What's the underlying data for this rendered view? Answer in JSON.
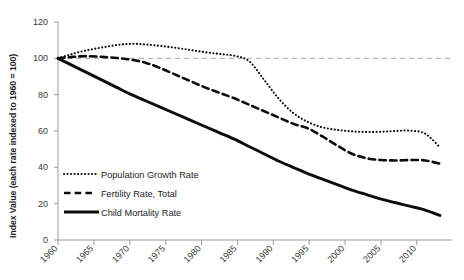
{
  "chart_data": {
    "type": "line",
    "title": "",
    "xlabel": "",
    "ylabel": "Index Value (each rate indexed to 1960 = 100)",
    "xlim": [
      1960,
      2012
    ],
    "ylim": [
      0,
      120
    ],
    "yticks": [
      0,
      20,
      40,
      60,
      80,
      100,
      120
    ],
    "ytick_labels": [
      "0",
      "20",
      "40",
      "60",
      "80",
      "100",
      "120"
    ],
    "xticks": [
      1960,
      1965,
      1970,
      1975,
      1980,
      1985,
      1990,
      1995,
      2000,
      2005,
      2010
    ],
    "xtick_labels": [
      "1960",
      "1965",
      "1970",
      "1975",
      "1980",
      "1985",
      "1990",
      "1995",
      "2000",
      "2005",
      "2010"
    ],
    "grid": false,
    "legend_position": "inside-lower-left",
    "reference_lines": [
      {
        "axis": "y",
        "value": 100,
        "style": "dashed",
        "color": "#a8a8a8"
      }
    ],
    "x": [
      1960,
      1962,
      1964,
      1966,
      1968,
      1970,
      1972,
      1974,
      1976,
      1978,
      1980,
      1982,
      1984,
      1986,
      1988,
      1990,
      1992,
      1994,
      1996,
      1998,
      2000,
      2002,
      2004,
      2006,
      2008,
      2010,
      2012
    ],
    "series": [
      {
        "name": "Population Growth Rate",
        "style": "dotted",
        "color": "#0d0d0d",
        "values": [
          100,
          102.5,
          104.5,
          106,
          107.3,
          108,
          107.6,
          106.8,
          105.8,
          104.6,
          103.4,
          102.4,
          101.4,
          98.5,
          88.5,
          78,
          70,
          65,
          62,
          60.6,
          59.8,
          59.5,
          59.6,
          60,
          60.2,
          58.5,
          51
        ]
      },
      {
        "name": "Fertility Rate, Total",
        "style": "dashed",
        "color": "#0d0d0d",
        "values": [
          100,
          100.8,
          101.2,
          100.8,
          100.2,
          99.2,
          97.5,
          94.5,
          91,
          87.5,
          84,
          81,
          78,
          74.5,
          71,
          67.5,
          64,
          61.5,
          57,
          52,
          47.5,
          45,
          44,
          43.8,
          44,
          43.8,
          42
        ]
      },
      {
        "name": "Child Mortality Rate",
        "style": "solid",
        "color": "#0d0d0d",
        "values": [
          100,
          96,
          92,
          88,
          84,
          80,
          76.5,
          73,
          69.5,
          66,
          62.5,
          59,
          55.5,
          51.5,
          47.5,
          43.5,
          40,
          36.5,
          33.5,
          30.5,
          27.5,
          25,
          22.5,
          20.5,
          18.5,
          16.5,
          13.5
        ]
      }
    ],
    "legend": [
      {
        "label": "Population Growth Rate",
        "style": "dotted"
      },
      {
        "label": "Fertility Rate, Total",
        "style": "dashed"
      },
      {
        "label": "Child Mortality Rate",
        "style": "solid"
      }
    ]
  }
}
